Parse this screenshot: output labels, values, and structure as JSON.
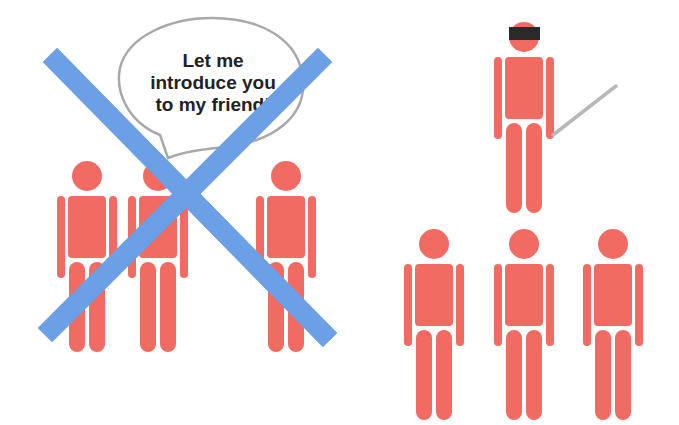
{
  "left_panel": {
    "description": "Crossed-out scene: one person introducing others",
    "speech_bubble": {
      "lines": [
        "Let me",
        "introduce you",
        "to my friend!"
      ]
    },
    "figure_count": 3,
    "cross_out": true
  },
  "right_panel": {
    "description": "Blindfolded presenter with a pointer above a group of three people",
    "presenter": {
      "blindfold": true,
      "pointer": true
    },
    "audience_count": 3
  },
  "colors": {
    "figure": "#f26b63",
    "cross": "#6b9fe6",
    "bubble_outline": "#a8a8a8",
    "blindfold": "#2a2a2a",
    "pointer": "#b8b8b8",
    "text": "#222222"
  }
}
